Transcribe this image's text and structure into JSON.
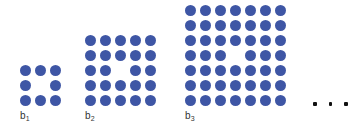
{
  "figures": [
    {
      "label": "b",
      "subscript": "1",
      "grid_size": 3,
      "hole": {
        "row": 2,
        "col": 2
      },
      "dot_count": 8
    },
    {
      "label": "b",
      "subscript": "2",
      "grid_size": 5,
      "hole": {
        "row": 3,
        "col": 3
      },
      "dot_count": 24
    },
    {
      "label": "b",
      "subscript": "3",
      "grid_size": 7,
      "hole": {
        "row": 4,
        "col": 4
      },
      "dot_count": 48
    }
  ],
  "ellipsis": {
    "count": 3
  },
  "colors": {
    "dot": "#3E56A5",
    "label": "#333333",
    "ellipsis": "#111111",
    "background": "#FFFFFF"
  }
}
